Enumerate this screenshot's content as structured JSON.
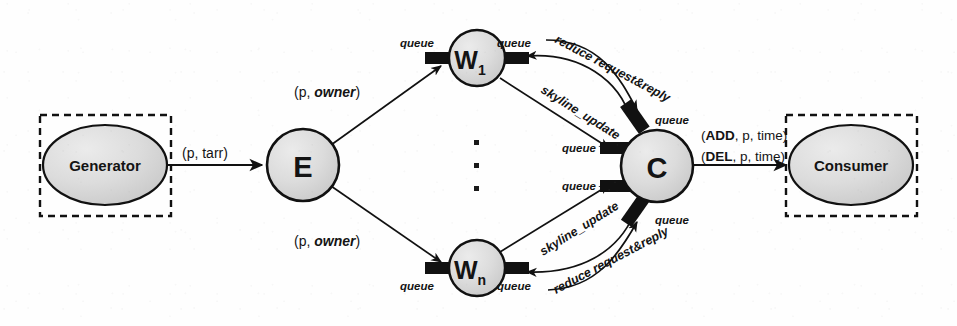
{
  "diagram": {
    "background_color": "#fefefe",
    "node_fill": "#d9d9d9",
    "node_stroke": "#111111",
    "queue_color": "#111111",
    "boundary_style": "dashed"
  },
  "nodes": {
    "generator": {
      "label": "Generator",
      "shape": "ellipse",
      "cx": 105,
      "cy": 165,
      "rx": 62,
      "ry": 40
    },
    "emitter": {
      "label": "E",
      "shape": "circle",
      "cx": 303,
      "cy": 165,
      "r": 36
    },
    "worker_first": {
      "label": "W",
      "sub": "1",
      "shape": "circle",
      "cx": 477,
      "cy": 58,
      "r": 28
    },
    "worker_last": {
      "label": "W",
      "sub": "n",
      "shape": "circle",
      "cx": 477,
      "cy": 268,
      "r": 28
    },
    "collector": {
      "label": "C",
      "shape": "circle",
      "cx": 657,
      "cy": 166,
      "r": 36
    },
    "consumer": {
      "label": "Consumer",
      "shape": "ellipse",
      "cx": 851,
      "cy": 165,
      "rx": 62,
      "ry": 40
    }
  },
  "boundaries": {
    "generator_box": {
      "x": 40,
      "y": 115,
      "w": 131,
      "h": 101
    },
    "consumer_box": {
      "x": 786,
      "y": 115,
      "w": 131,
      "h": 101
    }
  },
  "edge_labels": {
    "gen_to_e": "(p, tarr)",
    "e_to_w1_plain": "(p, ",
    "e_to_w1_emph": "owner",
    "e_to_w1_tail": ")",
    "e_to_wn_plain": "(p, ",
    "e_to_wn_emph": "owner",
    "e_to_wn_tail": ")",
    "skyline_update_top": "skyline_update",
    "skyline_update_bottom": "skyline_update",
    "reduce_top": "reduce request&reply",
    "reduce_bottom": "reduce request&reply",
    "c_to_consumer_add": "(ADD, p, time)",
    "c_to_consumer_del": "(DEL, p, time)",
    "add_keyword": "ADD",
    "del_keyword": "DEL",
    "add_rest": ", p, time)",
    "del_rest": ", p, time)",
    "add_open": "(",
    "del_open": "("
  },
  "queue_labels": {
    "w1_in": "queue",
    "w1_out": "queue",
    "wn_in": "queue",
    "wn_out": "queue",
    "c_top": "queue",
    "c_mid_upper": "queue",
    "c_mid_lower": "queue",
    "c_bottom": "queue"
  },
  "ellipsis": {
    "glyph": "▪",
    "count": 3,
    "x": 477,
    "ys": [
      143,
      166,
      189
    ]
  }
}
